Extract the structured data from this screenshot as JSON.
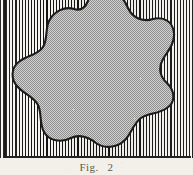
{
  "figure": {
    "caption_label": "Fig.",
    "caption_number": "2",
    "alt_description": "Scalloped closed curve filled with gray stipple, set against a vertically hatched rectangular ground",
    "panel": {
      "width": 193,
      "height": 158,
      "hatch_direction": "vertical",
      "hatch_period_px": 3,
      "hatch_line_color": "#141414",
      "hatch_gap_color": "#f6f5f0"
    },
    "shape": {
      "name": "lobed-blob",
      "lobe_count": 8,
      "fill_style": "stipple-halftone",
      "fill_color": "#b9b9b9",
      "outline_color": "#1a1a1a",
      "outline_width_px": 2,
      "cropped_at_top": true
    },
    "paper_color": "#f2f0e9",
    "frame_rule_color": "#232323"
  }
}
